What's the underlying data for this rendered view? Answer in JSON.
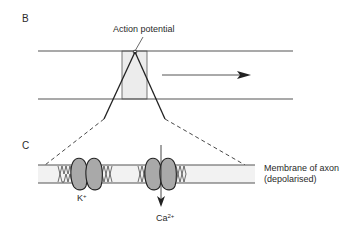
{
  "figure": {
    "panels": [
      {
        "id": "B",
        "label": "B"
      },
      {
        "id": "C",
        "label": "C"
      }
    ],
    "panel_b": {
      "annotation": "Action potential",
      "direction_arrow": "propagation-direction-right"
    },
    "panel_c": {
      "membrane_label_line1": "Membrane of axon",
      "membrane_label_line2": "(depolarised)",
      "channels": [
        {
          "ion": "K",
          "charge": "+",
          "type": "potassium-channel"
        },
        {
          "ion": "Ca",
          "charge": "2+",
          "type": "calcium-channel",
          "flow": "inward-down"
        }
      ]
    },
    "colors": {
      "line": "#3a3a3a",
      "channel_fill": "#a9a9a9",
      "membrane_fill": "#f2f2f2",
      "box_fill": "#ececec"
    }
  }
}
